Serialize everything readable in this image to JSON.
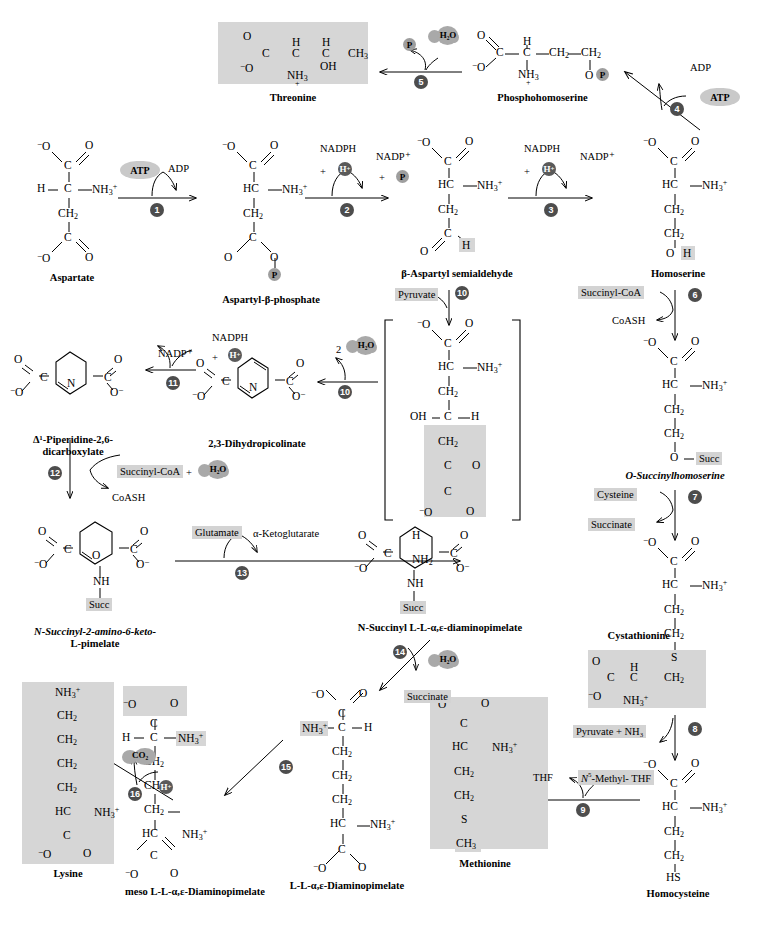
{
  "diagram": {
    "accent_gray": "#d3d3d3",
    "step_badge_color": "#4d4d4d",
    "blob_color": "#a8a8a8"
  },
  "compounds": {
    "aspartate": "Aspartate",
    "aspartyl_beta_phosphate": "Aspartyl-β-phosphate",
    "beta_aspartyl_semialdehyde": "β-Aspartyl semialdehyde",
    "homoserine": "Homoserine",
    "phosphohomoserine": "Phosphohomoserine",
    "threonine": "Threonine",
    "o_succinylhomoserine": "O-Succinylhomoserine",
    "cystathionine": "Cystathionine",
    "homocysteine": "Homocysteine",
    "methionine": "Methionine",
    "dihydropicolinate": "2,3-Dihydropicolinate",
    "piperidine_dicarboxylate_line1": "Δ¹-Piperidine-2,6-",
    "piperidine_dicarboxylate_line2": "dicarboxylate",
    "n_succinyl_keto_line1": "N-Succinyl-2-amino-6-keto-",
    "n_succinyl_keto_line2": "L-pimelate",
    "n_succinyl_dap": "N-Succinyl L-L-α,ε-diaminopimelate",
    "ll_dap": "L-L-α,ε-Diaminopimelate",
    "meso_dap": "meso L-L-α,ε-Diaminopimelate",
    "lysine": "Lysine"
  },
  "cofactors": {
    "atp": "ATP",
    "adp": "ADP",
    "nadph": "NADPH",
    "nadp_plus": "NADP⁺",
    "h_plus": "H⁺",
    "phosphate": "P",
    "water": "H₂O",
    "water_two": "2",
    "pyruvate": "Pyruvate",
    "succinyl_coa": "Succinyl-CoA",
    "coash": "CoASH",
    "cysteine": "Cysteine",
    "succinate": "Succinate",
    "glutamate": "Glutamate",
    "alpha_ketoglutarate": "α-Ketoglutarate",
    "pyruvate_plus_nh3": "Pyruvate  +  NH₃",
    "thf": "THF",
    "n5_methyl_thf": "N⁵-Methyl- THF",
    "co2": "CO₂",
    "plus": "+",
    "succ": "Succ"
  },
  "steps": [
    {
      "n": "1",
      "label": "aspartokinase"
    },
    {
      "n": "2",
      "label": "aspartate-semialdehyde dehydrogenase"
    },
    {
      "n": "3",
      "label": "homoserine dehydrogenase"
    },
    {
      "n": "4",
      "label": "homoserine kinase"
    },
    {
      "n": "5",
      "label": "threonine synthase"
    },
    {
      "n": "6",
      "label": "homoserine acyltransferase"
    },
    {
      "n": "7",
      "label": "cystathionine gamma-synthase"
    },
    {
      "n": "8",
      "label": "cystathionine beta-lyase"
    },
    {
      "n": "9",
      "label": "methionine synthase"
    },
    {
      "n": "10",
      "label": "dihydrodipicolinate synthase"
    },
    {
      "n": "11",
      "label": "dihydrodipicolinate reductase"
    },
    {
      "n": "12",
      "label": "succinyltransferase"
    },
    {
      "n": "13",
      "label": "aminotransferase"
    },
    {
      "n": "14",
      "label": "desuccinylase"
    },
    {
      "n": "15",
      "label": "epimerase"
    },
    {
      "n": "16",
      "label": "diaminopimelate decarboxylase"
    }
  ],
  "atoms": {
    "C": "C",
    "N": "N",
    "O": "O",
    "S": "S",
    "H": "H",
    "HC": "HC",
    "CH2": "CH₂",
    "CH3": "CH₃",
    "HS": "HS",
    "NH": "NH",
    "NH2": "NH₂",
    "NH3p": "NH₃⁺",
    "O_minus": "⁻O",
    "minus_O": "O⁻",
    "OH": "OH",
    "NH3_plus_left": "⁺NH₃"
  }
}
